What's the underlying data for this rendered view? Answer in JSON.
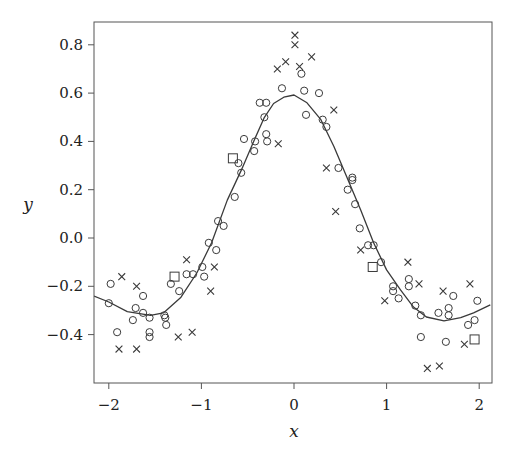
{
  "chart_data": {
    "type": "scatter",
    "title": "",
    "xlabel": "x",
    "ylabel": "y",
    "xlim": [
      -2.16,
      2.14
    ],
    "ylim": [
      -0.6,
      0.89
    ],
    "grid": false,
    "legend": null,
    "xticks": [
      -2,
      -1,
      0,
      1,
      2
    ],
    "xtick_labels": [
      "−2",
      "−1",
      "0",
      "1",
      "2"
    ],
    "yticks": [
      -0.4,
      -0.2,
      0.0,
      0.2,
      0.4,
      0.6,
      0.8
    ],
    "ytick_labels": [
      "−0.4",
      "−0.2",
      "0.0",
      "0.2",
      "0.4",
      "0.6",
      "0.8"
    ],
    "series": [
      {
        "name": "circles",
        "marker": "circle",
        "points": [
          [
            -1.98,
            -0.19
          ],
          [
            -2.0,
            -0.27
          ],
          [
            -1.91,
            -0.39
          ],
          [
            -1.63,
            -0.24
          ],
          [
            -1.71,
            -0.29
          ],
          [
            -1.74,
            -0.34
          ],
          [
            -1.63,
            -0.31
          ],
          [
            -1.56,
            -0.33
          ],
          [
            -1.56,
            -0.39
          ],
          [
            -1.56,
            -0.41
          ],
          [
            -1.4,
            -0.32
          ],
          [
            -1.39,
            -0.33
          ],
          [
            -1.38,
            -0.36
          ],
          [
            -1.33,
            -0.19
          ],
          [
            -1.24,
            -0.22
          ],
          [
            -1.16,
            -0.15
          ],
          [
            -1.09,
            -0.15
          ],
          [
            -0.97,
            -0.16
          ],
          [
            -0.99,
            -0.12
          ],
          [
            -0.92,
            -0.02
          ],
          [
            -0.84,
            -0.05
          ],
          [
            -0.82,
            0.07
          ],
          [
            -0.76,
            0.05
          ],
          [
            -0.64,
            0.17
          ],
          [
            -0.57,
            0.27
          ],
          [
            -0.6,
            0.31
          ],
          [
            -0.43,
            0.36
          ],
          [
            -0.42,
            0.4
          ],
          [
            -0.54,
            0.41
          ],
          [
            -0.3,
            0.43
          ],
          [
            -0.29,
            0.4
          ],
          [
            -0.32,
            0.5
          ],
          [
            -0.37,
            0.56
          ],
          [
            -0.3,
            0.56
          ],
          [
            -0.13,
            0.62
          ],
          [
            0.08,
            0.68
          ],
          [
            0.11,
            0.61
          ],
          [
            0.27,
            0.6
          ],
          [
            0.13,
            0.51
          ],
          [
            0.31,
            0.49
          ],
          [
            0.35,
            0.46
          ],
          [
            0.48,
            0.29
          ],
          [
            0.63,
            0.25
          ],
          [
            0.63,
            0.24
          ],
          [
            0.58,
            0.2
          ],
          [
            0.66,
            0.14
          ],
          [
            0.71,
            0.04
          ],
          [
            0.8,
            -0.03
          ],
          [
            0.86,
            -0.03
          ],
          [
            0.94,
            -0.1
          ],
          [
            1.07,
            -0.2
          ],
          [
            1.07,
            -0.22
          ],
          [
            1.13,
            -0.25
          ],
          [
            1.24,
            -0.17
          ],
          [
            1.24,
            -0.2
          ],
          [
            1.31,
            -0.28
          ],
          [
            1.37,
            -0.32
          ],
          [
            1.37,
            -0.41
          ],
          [
            1.56,
            -0.31
          ],
          [
            1.67,
            -0.29
          ],
          [
            1.67,
            -0.32
          ],
          [
            1.72,
            -0.24
          ],
          [
            1.64,
            -0.43
          ],
          [
            1.88,
            -0.36
          ],
          [
            1.95,
            -0.34
          ],
          [
            1.98,
            -0.26
          ]
        ]
      },
      {
        "name": "crosses",
        "marker": "x",
        "points": [
          [
            -1.86,
            -0.16
          ],
          [
            -1.7,
            -0.2
          ],
          [
            -1.89,
            -0.46
          ],
          [
            -1.7,
            -0.46
          ],
          [
            -1.25,
            -0.41
          ],
          [
            -1.1,
            -0.39
          ],
          [
            -1.16,
            -0.09
          ],
          [
            -0.86,
            -0.12
          ],
          [
            -0.9,
            -0.22
          ],
          [
            -0.17,
            0.39
          ],
          [
            -0.18,
            0.7
          ],
          [
            -0.09,
            0.73
          ],
          [
            0.01,
            0.84
          ],
          [
            0.01,
            0.8
          ],
          [
            0.06,
            0.71
          ],
          [
            0.19,
            0.75
          ],
          [
            0.43,
            0.53
          ],
          [
            0.35,
            0.29
          ],
          [
            0.45,
            0.11
          ],
          [
            0.72,
            -0.05
          ],
          [
            0.98,
            -0.26
          ],
          [
            1.23,
            -0.1
          ],
          [
            1.35,
            -0.19
          ],
          [
            1.61,
            -0.22
          ],
          [
            1.9,
            -0.19
          ],
          [
            1.84,
            -0.44
          ],
          [
            1.44,
            -0.54
          ],
          [
            1.57,
            -0.53
          ]
        ]
      },
      {
        "name": "squares",
        "marker": "square",
        "points": [
          [
            -1.29,
            -0.16
          ],
          [
            -0.66,
            0.33
          ],
          [
            0.85,
            -0.12
          ],
          [
            1.95,
            -0.42
          ]
        ]
      },
      {
        "name": "fitted curve",
        "marker": "line",
        "points": [
          [
            -2.16,
            -0.24
          ],
          [
            -2.0,
            -0.265
          ],
          [
            -1.8,
            -0.305
          ],
          [
            -1.55,
            -0.32
          ],
          [
            -1.41,
            -0.31
          ],
          [
            -1.22,
            -0.245
          ],
          [
            -1.05,
            -0.145
          ],
          [
            -0.89,
            -0.02
          ],
          [
            -0.72,
            0.157
          ],
          [
            -0.57,
            0.28
          ],
          [
            -0.43,
            0.405
          ],
          [
            -0.32,
            0.5
          ],
          [
            -0.22,
            0.557
          ],
          [
            -0.11,
            0.583
          ],
          [
            0.0,
            0.592
          ],
          [
            0.14,
            0.56
          ],
          [
            0.29,
            0.49
          ],
          [
            0.43,
            0.38
          ],
          [
            0.57,
            0.253
          ],
          [
            0.72,
            0.116
          ],
          [
            0.86,
            -0.02
          ],
          [
            1.0,
            -0.132
          ],
          [
            1.15,
            -0.215
          ],
          [
            1.29,
            -0.286
          ],
          [
            1.43,
            -0.327
          ],
          [
            1.62,
            -0.343
          ],
          [
            1.8,
            -0.33
          ],
          [
            1.94,
            -0.31
          ],
          [
            2.12,
            -0.277
          ]
        ]
      }
    ]
  }
}
